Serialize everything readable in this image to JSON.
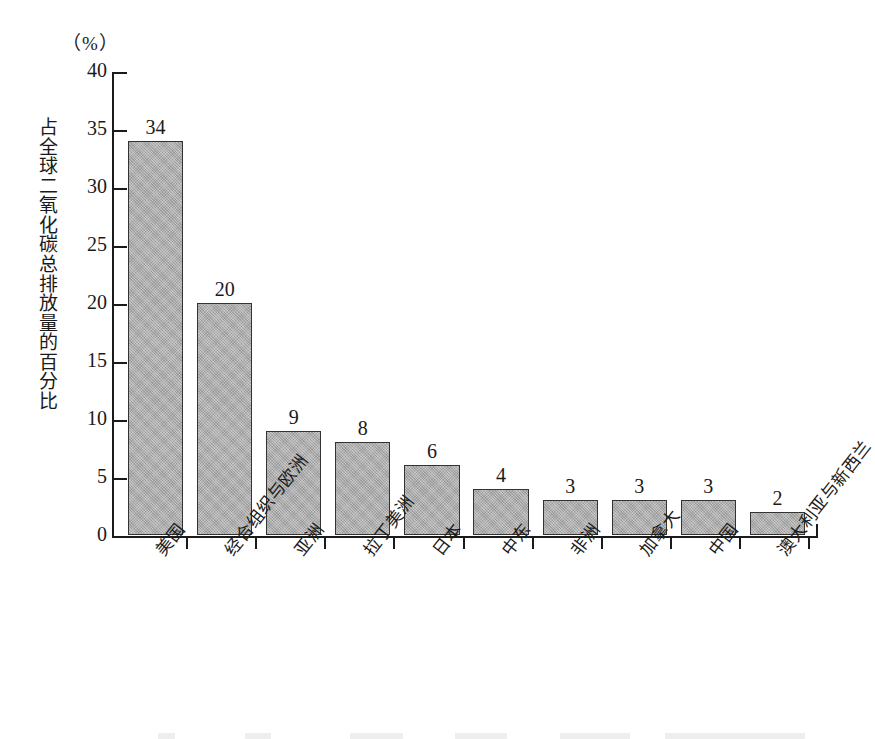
{
  "chart_data": {
    "type": "bar",
    "title": "",
    "unit_label": "（%）",
    "xlabel": "",
    "ylabel": "占全球二氧化碳总排放量的百分比",
    "ylim": [
      0,
      40
    ],
    "ytick_step": 5,
    "yticks": [
      "40",
      "35",
      "30",
      "25",
      "20",
      "15",
      "10",
      "5",
      "0"
    ],
    "grid": false,
    "legend": "none",
    "categories": [
      "美国",
      "经合组织与欧洲",
      "亚洲",
      "拉丁美洲",
      "日本",
      "中东",
      "非洲",
      "加拿大",
      "中国",
      "澳大利亚与新西兰"
    ],
    "values": [
      34,
      20,
      9,
      8,
      6,
      4,
      3,
      3,
      3,
      2
    ],
    "value_labels": [
      "34",
      "20",
      "9",
      "8",
      "6",
      "4",
      "3",
      "3",
      "3",
      "2"
    ],
    "bar_color": "#a9a9a9",
    "bar_border_color": "#333333",
    "axis_color": "#1a1a1a"
  }
}
